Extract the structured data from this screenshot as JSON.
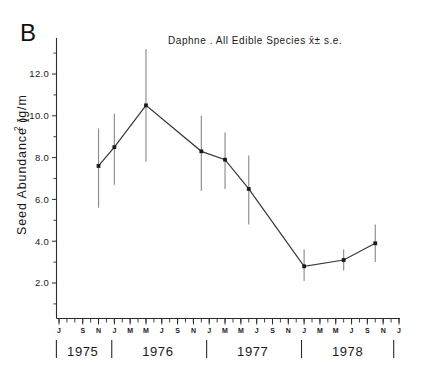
{
  "panel": {
    "letter": "B"
  },
  "chart_data": {
    "type": "line",
    "title": "Daphne . All Edible Species  x̄± s.e.",
    "title_parts": {
      "site": "Daphne .",
      "subject": "All Edible Species",
      "stat": "x̄± s.e."
    },
    "xlabel": "",
    "ylabel": "Seed  Abundance  (g/m²)",
    "ylabel_plain": "Seed Abundance (g/m2)",
    "ylim": [
      0,
      13.2
    ],
    "yticks": [
      2.0,
      4.0,
      6.0,
      8.0,
      10.0,
      12.0
    ],
    "ytick_labels": [
      "2.0",
      "4.0",
      "6.0",
      "8.0",
      "10.0",
      "12.0"
    ],
    "yminor_ticks": [
      1.0,
      3.0,
      5.0,
      7.0,
      9.0,
      11.0,
      13.0
    ],
    "grid": false,
    "legend": null,
    "xlim_months": [
      "1975-06",
      "1979-01"
    ],
    "xtick_months": [
      {
        "label": "J",
        "year": 1975,
        "month": 6
      },
      {
        "label": "S",
        "year": 1975,
        "month": 9
      },
      {
        "label": "N",
        "year": 1975,
        "month": 11
      },
      {
        "label": "J",
        "year": 1976,
        "month": 1
      },
      {
        "label": "M",
        "year": 1976,
        "month": 3
      },
      {
        "label": "M",
        "year": 1976,
        "month": 5
      },
      {
        "label": "J",
        "year": 1976,
        "month": 7
      },
      {
        "label": "S",
        "year": 1976,
        "month": 9
      },
      {
        "label": "N",
        "year": 1976,
        "month": 11
      },
      {
        "label": "J",
        "year": 1977,
        "month": 1
      },
      {
        "label": "M",
        "year": 1977,
        "month": 3
      },
      {
        "label": "M",
        "year": 1977,
        "month": 5
      },
      {
        "label": "J",
        "year": 1977,
        "month": 7
      },
      {
        "label": "S",
        "year": 1977,
        "month": 9
      },
      {
        "label": "N",
        "year": 1977,
        "month": 11
      },
      {
        "label": "J",
        "year": 1978,
        "month": 1
      },
      {
        "label": "M",
        "year": 1978,
        "month": 3
      },
      {
        "label": "M",
        "year": 1978,
        "month": 5
      },
      {
        "label": "J",
        "year": 1978,
        "month": 7
      },
      {
        "label": "S",
        "year": 1978,
        "month": 9
      },
      {
        "label": "N",
        "year": 1978,
        "month": 11
      },
      {
        "label": "J",
        "year": 1979,
        "month": 1
      }
    ],
    "year_groups": [
      {
        "label": "1975",
        "start_month": "1975-06",
        "end_month": "1975-12"
      },
      {
        "label": "1976",
        "start_month": "1976-01",
        "end_month": "1976-12"
      },
      {
        "label": "1977",
        "start_month": "1977-01",
        "end_month": "1977-12"
      },
      {
        "label": "1978",
        "start_month": "1978-01",
        "end_month": "1978-12"
      }
    ],
    "series": [
      {
        "name": "All Edible Species",
        "x_months": [
          "1975-11",
          "1976-01",
          "1976-05",
          "1976-12",
          "1977-03",
          "1977-06",
          "1978-01",
          "1978-06",
          "1978-10"
        ],
        "values": [
          7.6,
          8.5,
          10.5,
          8.3,
          7.9,
          6.5,
          2.8,
          3.1,
          3.9
        ],
        "err_low": [
          5.6,
          6.7,
          7.8,
          6.4,
          6.5,
          4.8,
          2.1,
          2.6,
          3.0
        ],
        "err_high": [
          9.4,
          10.1,
          13.2,
          10.0,
          9.2,
          8.1,
          3.6,
          3.6,
          4.8
        ]
      }
    ],
    "colors": {
      "axis": "#2b2b2b",
      "line": "#3a3a3a",
      "marker": "#1c1c1c",
      "error_bar": "#8c8c8c",
      "background": "#ffffff"
    }
  }
}
